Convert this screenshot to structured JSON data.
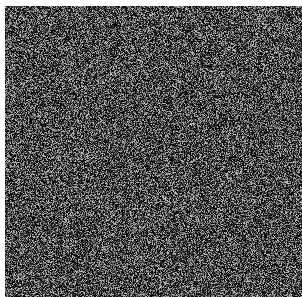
{
  "image": {
    "description": "Grayscale random noise texture",
    "width": 302,
    "height": 297,
    "background_color": "#ffffff",
    "border": {
      "top": 6,
      "left": 5,
      "right": 0,
      "bottom": 0,
      "color": "#ffffff"
    },
    "noise": {
      "pixel_size": 1,
      "mean_gray": 60,
      "min_gray": 0,
      "max_gray": 200,
      "dark_bias": 1.6,
      "seed": 1337
    }
  }
}
